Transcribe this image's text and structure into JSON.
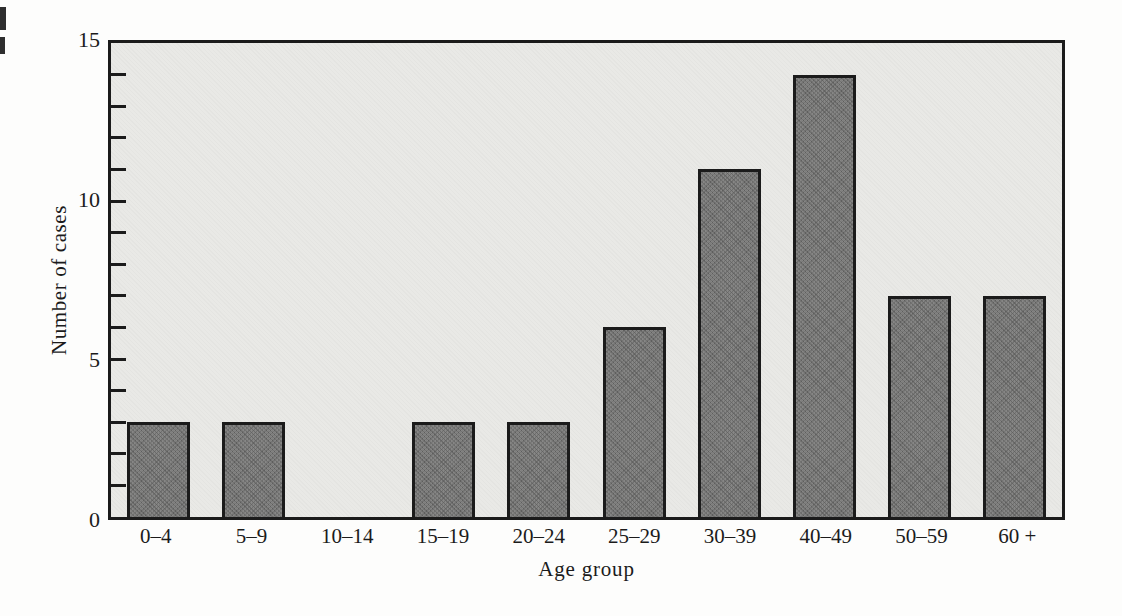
{
  "figure": {
    "ytick_labels": [
      "15",
      "10",
      "5",
      "0"
    ]
  },
  "chart_data": {
    "type": "bar",
    "categories": [
      "0–4",
      "5–9",
      "10–14",
      "15–19",
      "20–24",
      "25–29",
      "30–39",
      "40–49",
      "50–59",
      "60 +"
    ],
    "values": [
      3,
      3,
      0,
      3,
      3,
      6,
      11,
      14,
      7,
      7
    ],
    "title": "",
    "xlabel": "Age group",
    "ylabel": "Number of cases",
    "ylim": [
      0,
      15
    ],
    "yticks_labeled": [
      0,
      5,
      10,
      15
    ],
    "minor_tick_interval": 1,
    "grid": false,
    "legend": false,
    "colors": {
      "bar_fill": "#7f7f7e",
      "bar_border": "#1b1b1b",
      "plot_background": "#e9e9e6",
      "frame": "#1b1b1b",
      "page_background": "#fdfdfc",
      "text": "#1b1b1b"
    }
  }
}
